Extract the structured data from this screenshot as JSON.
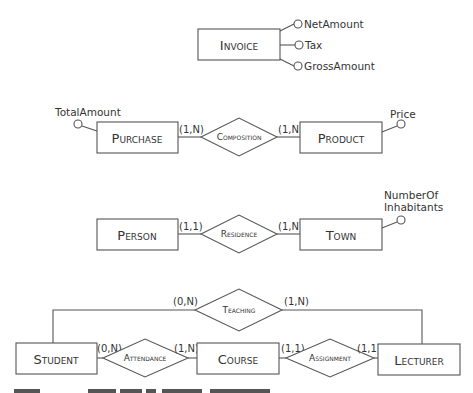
{
  "diagram": {
    "type": "entity-relationship",
    "invoice": {
      "entity": "Invoice",
      "attributes": [
        "NetAmount",
        "Tax",
        "GrossAmount"
      ]
    },
    "purchase_product": {
      "left_entity": "Purchase",
      "left_attribute": "TotalAmount",
      "relationship": "Composition",
      "left_cardinality": "(1,N)",
      "right_cardinality": "(1,N)",
      "right_entity": "Product",
      "right_attribute": "Price"
    },
    "person_town": {
      "left_entity": "Person",
      "relationship": "Residence",
      "left_cardinality": "(1,1)",
      "right_cardinality": "(1,N)",
      "right_entity": "Town",
      "right_attribute_line1": "NumberOf",
      "right_attribute_line2": "Inhabitants"
    },
    "university": {
      "student": "Student",
      "course": "Course",
      "lecturer": "Lecturer",
      "teaching": "Teaching",
      "attendance": "Attendance",
      "assignment": "Assignment",
      "teaching_left_card": "(0,N)",
      "teaching_right_card": "(1,N)",
      "attendance_left_card": "(0,N)",
      "attendance_right_card": "(1,N)",
      "assignment_left_card": "(1,1)",
      "assignment_right_card": "(1,1)"
    },
    "caption_partial": "Figure — Examples of relationships (cut off)"
  }
}
